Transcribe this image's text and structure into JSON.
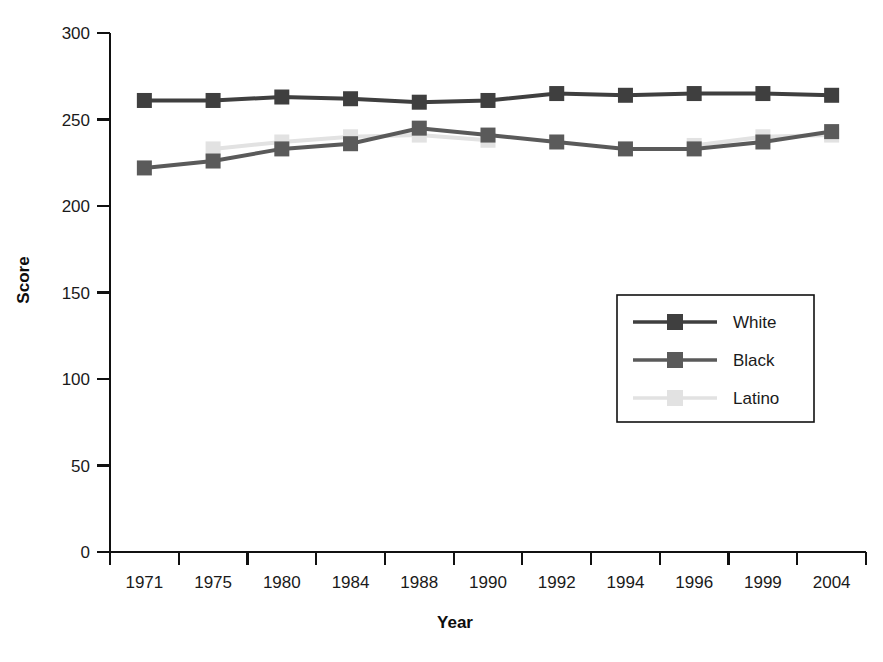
{
  "chart_data": {
    "type": "line",
    "title": "",
    "xlabel": "Year",
    "ylabel": "Score",
    "categories": [
      "1971",
      "1975",
      "1980",
      "1984",
      "1988",
      "1990",
      "1992",
      "1994",
      "1996",
      "1999",
      "2004"
    ],
    "ylim": [
      0,
      300
    ],
    "yticks": [
      0,
      50,
      100,
      150,
      200,
      250,
      300
    ],
    "ytick_labels": [
      "0",
      "50",
      "100",
      "150",
      "200",
      "250",
      "300"
    ],
    "grid": false,
    "legend_position": "center-right",
    "marker": "square",
    "series": [
      {
        "name": "White",
        "color": "#3f3f3f",
        "values": [
          261,
          261,
          263,
          262,
          260,
          261,
          265,
          264,
          265,
          265,
          264
        ]
      },
      {
        "name": "Black",
        "color": "#5a5a5a",
        "values": [
          222,
          226,
          233,
          236,
          245,
          241,
          237,
          233,
          233,
          237,
          243
        ]
      },
      {
        "name": "Latino",
        "color": "#e2e2e2",
        "values": [
          null,
          233,
          237,
          240,
          241,
          238,
          null,
          null,
          235,
          240,
          241
        ]
      }
    ]
  },
  "axes": {
    "y_title": "Score",
    "x_title": "Year"
  },
  "legend": {
    "entries": [
      {
        "label": "White",
        "color": "#3f3f3f"
      },
      {
        "label": "Black",
        "color": "#5a5a5a"
      },
      {
        "label": "Latino",
        "color": "#e2e2e2"
      }
    ]
  },
  "colors": {
    "axis": "#111111",
    "text": "#1a1a1a",
    "background": "#ffffff",
    "white_series": "#3f3f3f",
    "black_series": "#5a5a5a",
    "latino_series": "#e2e2e2"
  }
}
